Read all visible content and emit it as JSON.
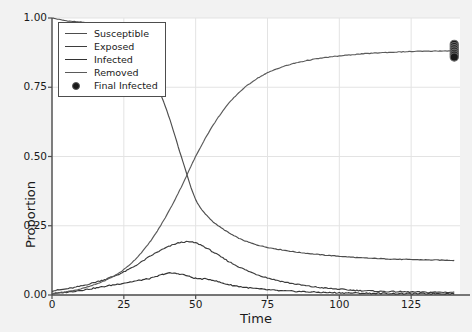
{
  "chart_data": {
    "type": "line",
    "title": "",
    "xlabel": "Time",
    "ylabel": "Proportion",
    "xlim": [
      0,
      142
    ],
    "ylim": [
      0.0,
      1.0
    ],
    "xticks": [
      0,
      25,
      50,
      75,
      100,
      125
    ],
    "xtick_labels": [
      "0",
      "25",
      "50",
      "75",
      "100",
      "125"
    ],
    "yticks": [
      0.0,
      0.25,
      0.5,
      0.75,
      1.0
    ],
    "ytick_labels": [
      "0.00",
      "0.25",
      "0.50",
      "0.75",
      "1.00"
    ],
    "grid": true,
    "legend_position": "upper left",
    "colors": {
      "susceptible": "#4d4d4d",
      "exposed": "#3d3d3d",
      "infected": "#333333",
      "removed": "#5a5a5a",
      "final_infected": "#1a1a1a",
      "grid": "#e3e3e3",
      "axis": "#4d4d4d",
      "plot_background": "#ffffff",
      "figure_background": "#f2f2f2"
    },
    "x": [
      0,
      5,
      10,
      15,
      20,
      25,
      30,
      35,
      40,
      45,
      50,
      55,
      60,
      65,
      70,
      75,
      80,
      85,
      90,
      95,
      100,
      105,
      110,
      115,
      120,
      125,
      130,
      135,
      140
    ],
    "series": [
      {
        "name": "Susceptible",
        "values": [
          1.0,
          0.99,
          0.985,
          0.975,
          0.96,
          0.93,
          0.875,
          0.79,
          0.665,
          0.5,
          0.345,
          0.275,
          0.235,
          0.205,
          0.185,
          0.172,
          0.163,
          0.155,
          0.149,
          0.144,
          0.14,
          0.136,
          0.133,
          0.131,
          0.129,
          0.128,
          0.127,
          0.126,
          0.125
        ]
      },
      {
        "name": "Exposed",
        "values": [
          0.015,
          0.022,
          0.032,
          0.046,
          0.062,
          0.083,
          0.112,
          0.145,
          0.172,
          0.19,
          0.188,
          0.162,
          0.13,
          0.102,
          0.079,
          0.062,
          0.049,
          0.039,
          0.031,
          0.025,
          0.021,
          0.017,
          0.015,
          0.013,
          0.012,
          0.011,
          0.01,
          0.01,
          0.01
        ]
      },
      {
        "name": "Infected",
        "values": [
          0.005,
          0.01,
          0.017,
          0.025,
          0.034,
          0.043,
          0.052,
          0.062,
          0.078,
          0.075,
          0.06,
          0.056,
          0.041,
          0.031,
          0.024,
          0.019,
          0.015,
          0.013,
          0.011,
          0.009,
          0.008,
          0.007,
          0.006,
          0.006,
          0.005,
          0.005,
          0.005,
          0.005,
          0.005
        ]
      },
      {
        "name": "Removed",
        "values": [
          0.005,
          0.012,
          0.022,
          0.038,
          0.06,
          0.092,
          0.14,
          0.205,
          0.29,
          0.39,
          0.5,
          0.595,
          0.672,
          0.73,
          0.772,
          0.802,
          0.823,
          0.838,
          0.849,
          0.857,
          0.863,
          0.868,
          0.872,
          0.875,
          0.877,
          0.879,
          0.88,
          0.881,
          0.882
        ]
      }
    ],
    "final_infected_points": {
      "name": "Final Infected",
      "x": [
        140,
        140,
        140,
        140,
        140,
        140,
        140
      ],
      "y": [
        0.905,
        0.897,
        0.889,
        0.881,
        0.873,
        0.866,
        0.859
      ]
    }
  },
  "legend": {
    "items": [
      {
        "label": "Susceptible",
        "marker": "line"
      },
      {
        "label": "Exposed",
        "marker": "line"
      },
      {
        "label": "Infected",
        "marker": "line"
      },
      {
        "label": "Removed",
        "marker": "line"
      },
      {
        "label": "Final Infected",
        "marker": "circle"
      }
    ]
  }
}
